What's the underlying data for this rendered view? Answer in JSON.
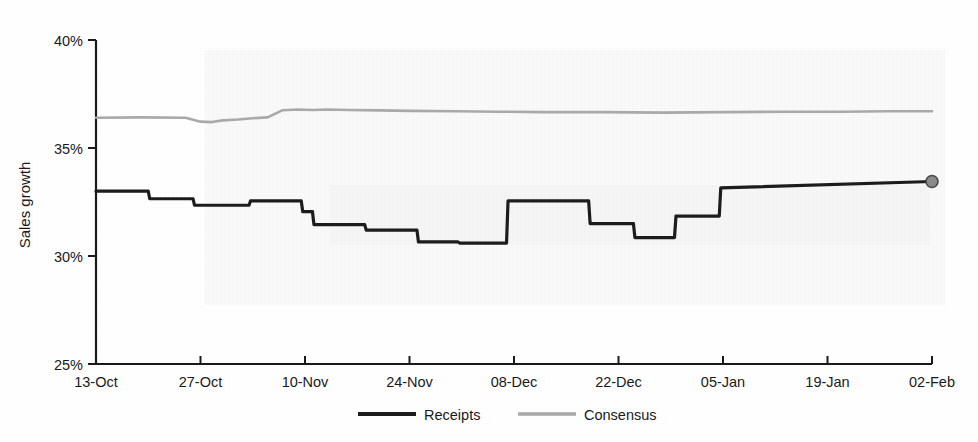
{
  "chart_data": {
    "type": "line",
    "title": "",
    "xlabel": "",
    "ylabel": "Sales growth",
    "ylim": [
      25,
      40
    ],
    "ytick_labels": [
      "25%",
      "30%",
      "35%",
      "40%"
    ],
    "ytick_values": [
      25,
      30,
      35,
      40
    ],
    "grid": false,
    "legend_position": "bottom-center",
    "x_tick_labels": [
      "13-Oct",
      "27-Oct",
      "10-Nov",
      "24-Nov",
      "08-Dec",
      "22-Dec",
      "05-Jan",
      "19-Jan",
      "02-Feb"
    ],
    "x_tick_values": [
      0,
      14,
      28,
      42,
      56,
      70,
      84,
      98,
      112
    ],
    "xlim": [
      0,
      112
    ],
    "series": [
      {
        "name": "Receipts",
        "color": "#1c1c1c",
        "style": "step",
        "width": 3.2,
        "end_marker": {
          "shape": "circle",
          "fill": "#8a8a8a",
          "edge": "#4a4a4a",
          "radius": 6,
          "x": 112,
          "y": 33.45
        },
        "x": [
          0,
          7.0,
          7.2,
          13.0,
          13.2,
          20.5,
          20.7,
          27.5,
          27.7,
          29.0,
          29.2,
          36.0,
          36.2,
          43.0,
          43.2,
          48.5,
          48.7,
          55.0,
          55.2,
          60.0,
          60.2,
          66.0,
          66.2,
          72.0,
          72.2,
          77.5,
          77.7,
          83.5,
          83.7,
          112
        ],
        "y": [
          33.0,
          33.0,
          32.65,
          32.65,
          32.35,
          32.35,
          32.55,
          32.55,
          32.05,
          32.05,
          31.45,
          31.45,
          31.2,
          31.2,
          30.65,
          30.65,
          30.6,
          30.6,
          32.55,
          32.55,
          32.55,
          32.55,
          31.5,
          31.5,
          30.85,
          30.85,
          31.85,
          31.85,
          33.15,
          33.45
        ],
        "points": [
          {
            "x": 0,
            "y": 33.0
          },
          {
            "x": 7,
            "y": 32.65
          },
          {
            "x": 13,
            "y": 32.35
          },
          {
            "x": 20.5,
            "y": 32.55
          },
          {
            "x": 27.5,
            "y": 32.05
          },
          {
            "x": 29,
            "y": 31.45
          },
          {
            "x": 36,
            "y": 31.2
          },
          {
            "x": 43,
            "y": 30.65
          },
          {
            "x": 48.5,
            "y": 30.6
          },
          {
            "x": 55,
            "y": 32.55
          },
          {
            "x": 60,
            "y": 32.55
          },
          {
            "x": 66,
            "y": 31.5
          },
          {
            "x": 72,
            "y": 30.85
          },
          {
            "x": 77.5,
            "y": 31.85
          },
          {
            "x": 83.5,
            "y": 33.15
          },
          {
            "x": 112,
            "y": 33.45
          }
        ]
      },
      {
        "name": "Consensus",
        "color": "#a9a9a9",
        "style": "line",
        "width": 2.6,
        "x": [
          0,
          6,
          12,
          14,
          15.5,
          17,
          19,
          21,
          23,
          25,
          27,
          29,
          31,
          34,
          38,
          42,
          48,
          54,
          60,
          68,
          76,
          84,
          92,
          100,
          106,
          112
        ],
        "y": [
          36.4,
          36.42,
          36.4,
          36.22,
          36.2,
          36.28,
          36.32,
          36.38,
          36.42,
          36.75,
          36.78,
          36.76,
          36.78,
          36.76,
          36.74,
          36.72,
          36.7,
          36.68,
          36.66,
          36.66,
          36.64,
          36.66,
          36.68,
          36.68,
          36.7,
          36.7
        ]
      }
    ]
  },
  "axis": {
    "y_axis_title": "Sales growth"
  },
  "legend": {
    "items": [
      {
        "label": "Receipts",
        "color": "#1c1c1c"
      },
      {
        "label": "Consensus",
        "color": "#a9a9a9"
      }
    ]
  }
}
